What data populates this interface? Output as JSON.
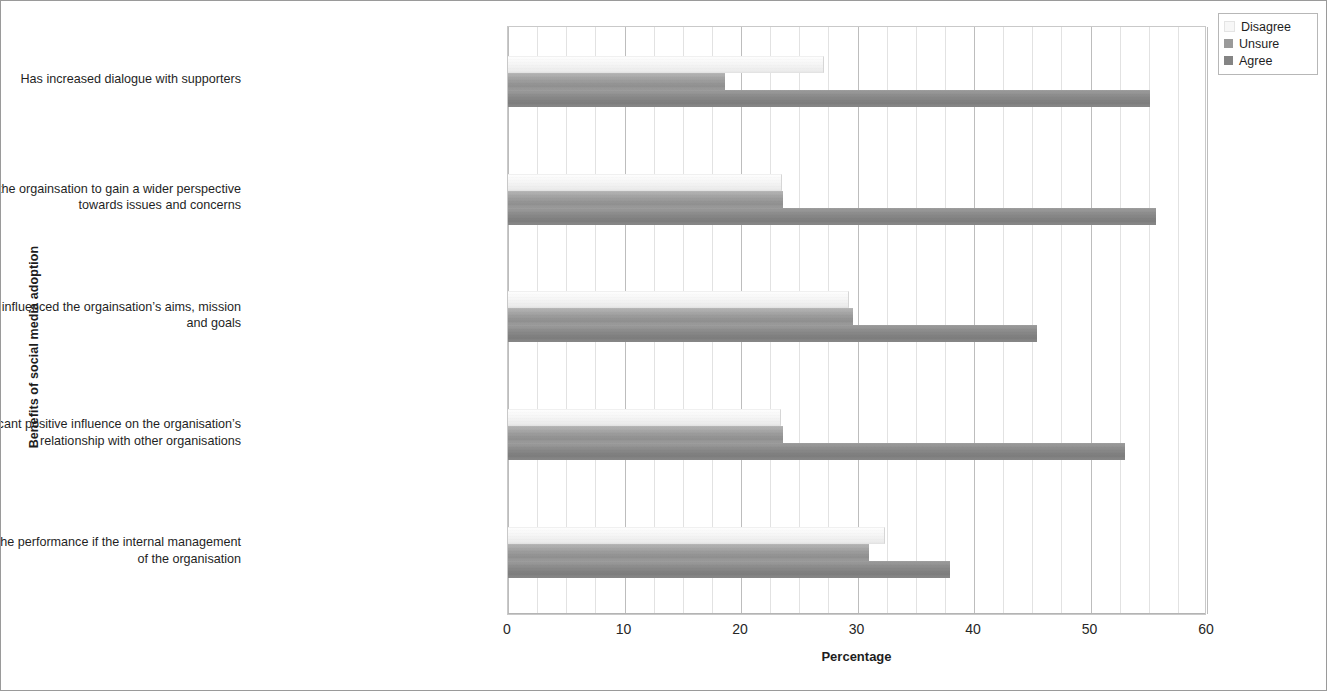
{
  "chart_data": {
    "type": "bar",
    "orientation": "horizontal",
    "title": "",
    "xlabel": "Percentage",
    "ylabel": "Benefits of social media adoption",
    "xlim": [
      0,
      60
    ],
    "xticks": [
      0,
      10,
      20,
      30,
      40,
      50,
      60
    ],
    "minor_tick_step": 2.5,
    "grid": "vertical",
    "legend_position": "top-right",
    "categories": [
      "Has increased dialogue with supporters",
      "Has helped the orgainsation to gain a wider perspective towards issues and concerns",
      "Has positively influenced the orgainsation’s aims, mission and goals",
      "Has a significant positive influence on the organisation’s relationship with other organisations",
      "Has assisted in the performance if the internal management of the organisation"
    ],
    "series": [
      {
        "name": "Disagree",
        "color": "#f7f7f7",
        "values": [
          27.1,
          23.5,
          29.3,
          23.4,
          32.4
        ]
      },
      {
        "name": "Unsure",
        "color": "#9a9a9a",
        "values": [
          18.6,
          23.6,
          29.6,
          23.6,
          31.0
        ]
      },
      {
        "name": "Agree",
        "color": "#848484",
        "values": [
          55.1,
          55.6,
          45.4,
          53.0,
          37.9
        ]
      }
    ]
  },
  "legend": {
    "items": [
      {
        "label": "Disagree"
      },
      {
        "label": "Unsure"
      },
      {
        "label": "Agree"
      }
    ]
  },
  "axis": {
    "x_title": "Percentage",
    "y_title": "Benefits of social media adoption",
    "x_tick_labels": [
      "0",
      "10",
      "20",
      "30",
      "40",
      "50",
      "60"
    ]
  },
  "category_labels": [
    {
      "lines": [
        "Has increased dialogue with supporters"
      ]
    },
    {
      "lines": [
        "Has helped the orgainsation to gain a wider perspective",
        "towards issues and concerns"
      ]
    },
    {
      "lines": [
        "Has positively influenced the orgainsation’s aims, mission",
        "and goals"
      ]
    },
    {
      "lines": [
        "Has a significant positive influence on the organisation’s",
        "relationship with other organisations"
      ]
    },
    {
      "lines": [
        "Has assisted in the performance if the internal management",
        "of the organisation"
      ]
    }
  ]
}
